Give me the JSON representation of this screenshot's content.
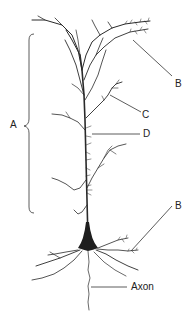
{
  "diagram": {
    "labels": {
      "a": "A",
      "b_top": "B",
      "c": "C",
      "d": "D",
      "b_bottom": "B",
      "axon": "Axon"
    },
    "colors": {
      "ink": "#2a2a2a",
      "background": "#ffffff"
    }
  }
}
